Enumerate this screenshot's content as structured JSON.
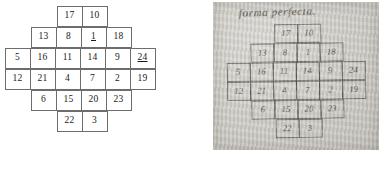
{
  "figure": {
    "typeset": {
      "name": "diamond-magic-square",
      "rows": [
        [
          {
            "v": "",
            "on": false
          },
          {
            "v": "",
            "on": false
          },
          {
            "v": "17",
            "on": true
          },
          {
            "v": "10",
            "on": true
          },
          {
            "v": "",
            "on": false
          },
          {
            "v": "",
            "on": false
          }
        ],
        [
          {
            "v": "",
            "on": false
          },
          {
            "v": "13",
            "on": true
          },
          {
            "v": "8",
            "on": true
          },
          {
            "v": "1",
            "on": true,
            "underline": true
          },
          {
            "v": "18",
            "on": true
          },
          {
            "v": "",
            "on": false
          }
        ],
        [
          {
            "v": "5",
            "on": true
          },
          {
            "v": "16",
            "on": true
          },
          {
            "v": "11",
            "on": true
          },
          {
            "v": "14",
            "on": true
          },
          {
            "v": "9",
            "on": true
          },
          {
            "v": "24",
            "on": true,
            "underline": true
          }
        ],
        [
          {
            "v": "12",
            "on": true
          },
          {
            "v": "21",
            "on": true
          },
          {
            "v": "4",
            "on": true
          },
          {
            "v": "7",
            "on": true
          },
          {
            "v": "2",
            "on": true
          },
          {
            "v": "19",
            "on": true
          }
        ],
        [
          {
            "v": "",
            "on": false
          },
          {
            "v": "6",
            "on": true
          },
          {
            "v": "15",
            "on": true
          },
          {
            "v": "20",
            "on": true
          },
          {
            "v": "23",
            "on": true
          },
          {
            "v": "",
            "on": false
          }
        ],
        [
          {
            "v": "",
            "on": false
          },
          {
            "v": "",
            "on": false
          },
          {
            "v": "22",
            "on": true
          },
          {
            "v": "3",
            "on": true
          },
          {
            "v": "",
            "on": false
          },
          {
            "v": "",
            "on": false
          }
        ]
      ]
    },
    "manuscript": {
      "name": "handwritten-manuscript-photo",
      "title": "forma perfecta.",
      "rows": [
        [
          {
            "v": "",
            "on": false
          },
          {
            "v": "",
            "on": false
          },
          {
            "v": "17",
            "on": true
          },
          {
            "v": "10",
            "on": true
          },
          {
            "v": "",
            "on": false
          },
          {
            "v": "",
            "on": false
          }
        ],
        [
          {
            "v": "",
            "on": false
          },
          {
            "v": "13",
            "on": true
          },
          {
            "v": "8",
            "on": true
          },
          {
            "v": "1",
            "on": true
          },
          {
            "v": "18",
            "on": true
          },
          {
            "v": "",
            "on": false
          }
        ],
        [
          {
            "v": "5",
            "on": true
          },
          {
            "v": "16",
            "on": true
          },
          {
            "v": "11",
            "on": true
          },
          {
            "v": "14",
            "on": true
          },
          {
            "v": "9",
            "on": true
          },
          {
            "v": "24",
            "on": true
          }
        ],
        [
          {
            "v": "12",
            "on": true
          },
          {
            "v": "21",
            "on": true
          },
          {
            "v": "4",
            "on": true
          },
          {
            "v": "7",
            "on": true
          },
          {
            "v": "2",
            "on": true
          },
          {
            "v": "19",
            "on": true
          }
        ],
        [
          {
            "v": "",
            "on": false
          },
          {
            "v": "6",
            "on": true
          },
          {
            "v": "15",
            "on": true
          },
          {
            "v": "20",
            "on": true
          },
          {
            "v": "23",
            "on": true
          },
          {
            "v": "",
            "on": false
          }
        ],
        [
          {
            "v": "",
            "on": false
          },
          {
            "v": "",
            "on": false
          },
          {
            "v": "22",
            "on": true
          },
          {
            "v": "3",
            "on": true
          },
          {
            "v": "",
            "on": false
          },
          {
            "v": "",
            "on": false
          }
        ]
      ]
    }
  },
  "colors": {
    "grid_line": "#6d6d6d",
    "text": "#1a1a1a",
    "page_background": "#ffffff",
    "manuscript_paper": "#cbc9c3",
    "manuscript_ink": "#332f29"
  }
}
